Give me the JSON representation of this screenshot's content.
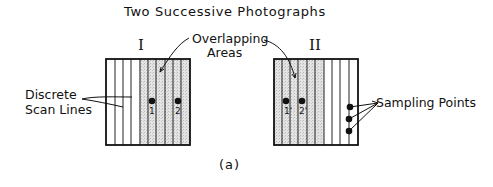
{
  "figure": {
    "title": "Two Successive Photographs",
    "caption": "(a)",
    "photo_1": {
      "label": "I",
      "points": [
        "1",
        "2"
      ]
    },
    "photo_2": {
      "label": "II",
      "points": [
        "1'",
        "2'"
      ]
    },
    "annotations": {
      "overlap_line1": "Overlapping",
      "overlap_line2": "Areas",
      "scan_line1": "Discrete",
      "scan_line2": "Scan Lines",
      "sampling": "Sampling Points"
    },
    "colors": {
      "ink": "#111111",
      "overlap_fill": "#d9d9d9",
      "background": "#ffffff"
    }
  }
}
